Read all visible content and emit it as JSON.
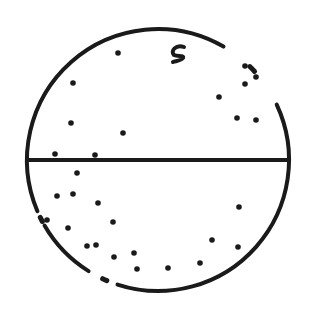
{
  "diagram": {
    "stroke_color": "#1a1a1a",
    "background": "#ffffff",
    "circle": {
      "cx": 158,
      "cy": 160,
      "r": 131
    },
    "diameter_line": {
      "x1": 28,
      "y1": 160,
      "x2": 288,
      "y2": 160
    },
    "curl_mark": {
      "x": 178,
      "y": 55,
      "label": "c-shaped mark"
    },
    "outline_gaps": [
      {
        "start_deg": 300,
        "end_deg": 335
      },
      {
        "start_deg": 108,
        "end_deg": 122
      },
      {
        "start_deg": 150,
        "end_deg": 157
      }
    ],
    "dots_upper": [
      [
        118,
        53
      ],
      [
        73,
        83
      ],
      [
        71,
        123
      ],
      [
        123,
        133
      ],
      [
        219,
        97
      ],
      [
        237,
        118
      ],
      [
        256,
        120
      ],
      [
        245,
        66
      ],
      [
        256,
        77
      ],
      [
        245,
        84
      ],
      [
        55,
        154
      ],
      [
        95,
        155
      ]
    ],
    "dots_lower": [
      [
        77,
        173
      ],
      [
        57,
        196
      ],
      [
        73,
        194
      ],
      [
        98,
        203
      ],
      [
        47,
        220
      ],
      [
        68,
        228
      ],
      [
        113,
        222
      ],
      [
        87,
        246
      ],
      [
        96,
        245
      ],
      [
        114,
        257
      ],
      [
        134,
        253
      ],
      [
        137,
        269
      ],
      [
        168,
        268
      ],
      [
        200,
        263
      ],
      [
        212,
        240
      ],
      [
        238,
        247
      ],
      [
        239,
        207
      ]
    ]
  }
}
